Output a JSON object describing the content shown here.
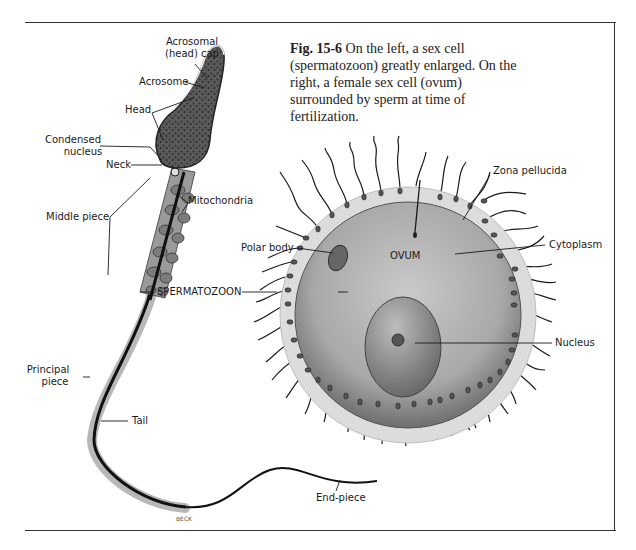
{
  "caption": {
    "fig_number": "Fig. 15-6",
    "text": " On the left, a sex cell (spermatozoon) greatly enlarged. On the right, a female sex cell (ovum) surrounded by sperm at time of fertilization."
  },
  "labels": {
    "acrosomal_cap_line1": "Acrosomal",
    "acrosomal_cap_line2": "(head) cap",
    "acrosome": "Acrosome",
    "head": "Head",
    "condensed_nucleus_line1": "Condensed",
    "condensed_nucleus_line2": "nucleus",
    "neck": "Neck",
    "mitochondria": "Mitochondria",
    "middle_piece": "Middle piece",
    "spermatozoon": "SPERMATOZOON",
    "principal_piece_line1": "Principal",
    "principal_piece_line2": "piece",
    "tail": "Tail",
    "end_piece": "End-piece",
    "artist_signature": "BECK",
    "zona_pellucida": "Zona pellucida",
    "polar_body": "Polar body",
    "ovum": "OVUM",
    "cytoplasm": "Cytoplasm",
    "nucleus": "Nucleus"
  },
  "colors": {
    "line": "#1a1a1a",
    "frame": "#333333",
    "zona": "#d8d8d8",
    "cytoplasm": "#a9a9a9",
    "nucleus": "#8a8a8a",
    "sperm_body": "#9a9a9a"
  }
}
